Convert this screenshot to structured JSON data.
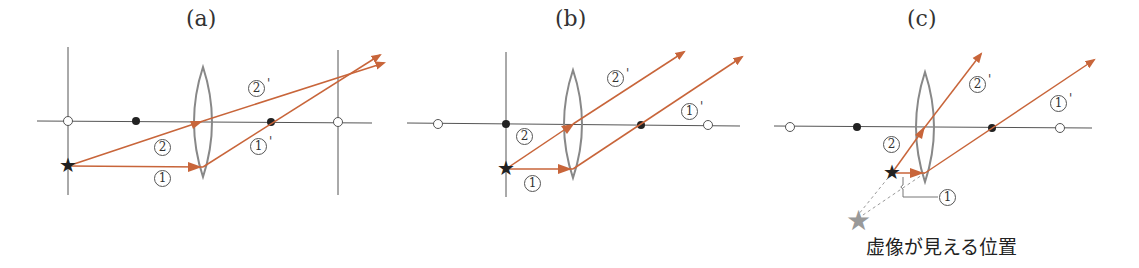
{
  "panels": [
    {
      "id": "a",
      "title": "(a)",
      "labels": {
        "ray1": "1",
        "ray2": "2",
        "ray1_out": "1",
        "ray2_out": "2",
        "prime": "'"
      }
    },
    {
      "id": "b",
      "title": "(b)",
      "labels": {
        "ray1": "1",
        "ray2": "2",
        "ray1_out": "1",
        "ray2_out": "2",
        "prime": "'"
      }
    },
    {
      "id": "c",
      "title": "(c)",
      "labels": {
        "ray1": "1",
        "ray2": "2",
        "ray1_out": "1",
        "ray2_out": "2",
        "prime": "'"
      },
      "caption": "虚像が見える位置"
    }
  ],
  "colors": {
    "ray": "#c8653a",
    "axis": "#555555",
    "lens": "#888888",
    "virtual_star": "#999999",
    "star": "#222222"
  }
}
